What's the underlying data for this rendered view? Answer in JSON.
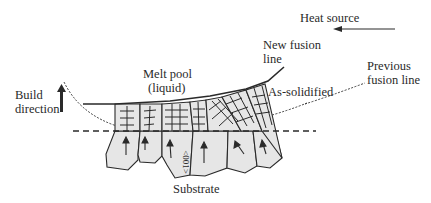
{
  "labels": {
    "heat_source": "Heat source",
    "new_fusion_line_1": "New fusion",
    "new_fusion_line_2": "line",
    "previous_fusion_line_1": "Previous",
    "previous_fusion_line_2": "fusion line",
    "melt_pool_1": "Melt pool",
    "melt_pool_2": "(liquid)",
    "as_solidified": "As-solidified",
    "build_direction_1": "Build",
    "build_direction_2": "direction",
    "substrate": "Substrate",
    "crystal_direction": "<001>"
  },
  "colors": {
    "line": "#2a2a2a",
    "grain_fill": "#e6e6e6",
    "background": "#ffffff"
  }
}
